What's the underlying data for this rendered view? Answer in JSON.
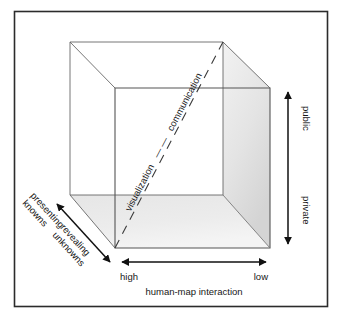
{
  "figure": {
    "frame": {
      "color": "#2b2b2b"
    },
    "cube": {
      "edge_color": "#555555",
      "face_shade_light": "#ededed",
      "face_shade_mid": "#dedede",
      "face_shade_dark": "#d2d2d2"
    },
    "axes": {
      "horizontal": {
        "name": "human-map interaction",
        "label": "human-map interaction",
        "left_tick": "high",
        "right_tick": "low",
        "arrow": "double"
      },
      "vertical": {
        "name": "audience",
        "top_tick": "public",
        "bottom_tick": "private",
        "arrow": "double"
      },
      "depth": {
        "name": "data relations",
        "far_tick_line1": "presenting",
        "far_tick_line2": "knowns",
        "near_tick_line1": "revealing",
        "near_tick_line2": "unknowns",
        "arrow": "double"
      },
      "diagonal": {
        "start_label": "visualization",
        "dash_separator": "—  —",
        "end_label": "communication",
        "style": "dashed"
      }
    }
  }
}
